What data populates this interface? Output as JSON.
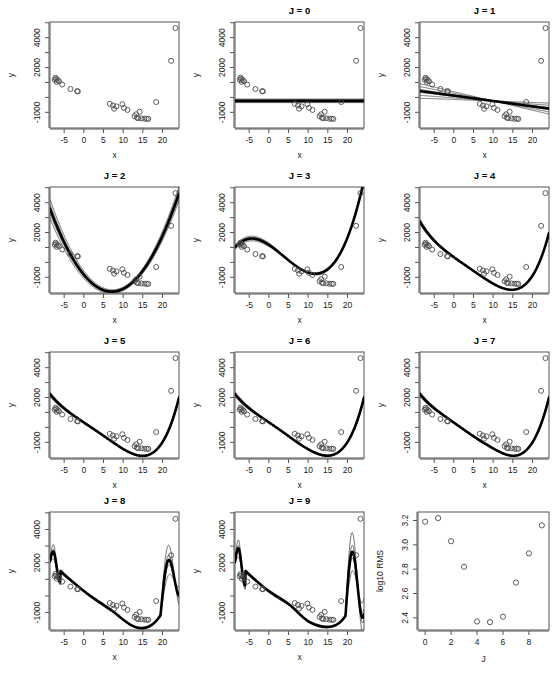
{
  "figure": {
    "title": "",
    "rows": 4,
    "cols": 3,
    "panel_count": 12
  },
  "axis_labels": {
    "x": "x",
    "y": "y",
    "rms_x": "J",
    "rms_y": "log10 RMS"
  },
  "panel_titles": {
    "p0": "",
    "p1": "J = 0",
    "p2": "J = 1",
    "p3": "J = 2",
    "p4": "J = 3",
    "p5": "J = 4",
    "p6": "J = 5",
    "p7": "J = 6",
    "p8": "J = 7",
    "p9": "J = 8",
    "p10": "J = 9",
    "p11": ""
  },
  "scatter_axes": {
    "xlim": [
      -8.6,
      24.2
    ],
    "ylim": [
      -2050,
      5050
    ],
    "x_ticks": [
      -5,
      0,
      5,
      10,
      15,
      20
    ],
    "x_tick_labels": [
      "-5",
      "0",
      "5",
      "10",
      "15",
      "20"
    ],
    "y_ticks": [
      -1000,
      0,
      1000,
      2000,
      3000,
      4000,
      5000
    ],
    "y_tick_labels": [
      "-1000",
      "",
      "",
      "2000",
      "",
      "4000",
      ""
    ],
    "grid": false
  },
  "chart_data": [
    {
      "type": "scatter",
      "title": "",
      "xlabel": "x",
      "ylabel": "y",
      "xlim": [
        -8.6,
        24.2
      ],
      "ylim": [
        -2050,
        5050
      ],
      "grid": false,
      "x": [
        -7.4,
        -7.2,
        -7.0,
        -6.9,
        -6.6,
        -6.3,
        -5.5,
        -3.4,
        -1.7,
        -1.5,
        6.6,
        7.4,
        7.7,
        8.3,
        9.8,
        10.2,
        11.1,
        12.9,
        13.3,
        13.5,
        13.8,
        14.2,
        14.6,
        15.4,
        16.0,
        16.4,
        18.4,
        22.2,
        23.3
      ],
      "y": [
        1180,
        1320,
        1230,
        1040,
        1160,
        1080,
        860,
        560,
        420,
        400,
        -430,
        -540,
        -760,
        -600,
        -460,
        -700,
        -840,
        -1260,
        -1130,
        -1360,
        -1390,
        -960,
        -1400,
        -1430,
        -1430,
        -1440,
        -310,
        2450,
        4640
      ],
      "series": []
    },
    {
      "type": "line",
      "title": "J = 0",
      "degree": 0,
      "xlabel": "x",
      "ylabel": "y",
      "main_fit_coeffs": [
        -230
      ],
      "bootstrap_fits": [
        [
          -150
        ],
        [
          -200
        ],
        [
          -260
        ],
        [
          -310
        ],
        [
          -120
        ],
        [
          -350
        ]
      ]
    },
    {
      "type": "line",
      "title": "J = 1",
      "degree": 1,
      "xlabel": "x",
      "ylabel": "y",
      "main_fit_coeffs": [
        120,
        -36
      ],
      "bootstrap_fits": [
        [
          260,
          -62
        ],
        [
          180,
          -50
        ],
        [
          60,
          -28
        ],
        [
          420,
          -86
        ],
        [
          330,
          -74
        ],
        [
          -20,
          -18
        ]
      ]
    },
    {
      "type": "line",
      "title": "J = 2",
      "degree": 2,
      "xlabel": "x",
      "ylabel": "y",
      "main_fit_coeffs": [
        -820,
        -320,
        22.5
      ],
      "bootstrap_fits": [
        [
          -620,
          -280,
          18.5
        ],
        [
          -700,
          -300,
          20.0
        ],
        [
          -900,
          -330,
          23.5
        ],
        [
          -520,
          -250,
          16.0
        ],
        [
          -760,
          -310,
          21.5
        ]
      ]
    },
    {
      "type": "line",
      "title": "J = 3",
      "degree": 3,
      "xlabel": "x",
      "ylabel": "y",
      "main_fit_coeffs": [
        1180,
        -172,
        -12.6,
        1.12
      ],
      "bootstrap_fits": [
        [
          1250,
          -160,
          -13.4,
          1.16
        ],
        [
          1100,
          -185,
          -11.8,
          1.08
        ],
        [
          1320,
          -150,
          -14.0,
          1.2
        ],
        [
          1040,
          -195,
          -11.2,
          1.04
        ]
      ]
    },
    {
      "type": "line",
      "title": "J = 4",
      "degree": 4,
      "xlabel": "x",
      "ylabel": "y",
      "main_fit_coeffs": [
        350,
        -190,
        3.0,
        -0.52,
        0.0345
      ],
      "bootstrap_fits": [
        [
          380,
          -186,
          2.8,
          -0.5,
          0.034
        ],
        [
          330,
          -194,
          3.2,
          -0.54,
          0.035
        ]
      ]
    },
    {
      "type": "line",
      "title": "J = 5",
      "degree": 5,
      "xlabel": "x",
      "ylabel": "y",
      "main_fit_coeffs": [
        330,
        -175,
        0.5,
        -0.35,
        0.0255,
        0.00022
      ],
      "bootstrap_fits": [
        [
          360,
          -170,
          0.2,
          -0.33,
          0.0248,
          0.00026
        ],
        [
          300,
          -180,
          0.9,
          -0.37,
          0.0262,
          0.00018
        ],
        [
          345,
          -178,
          0.6,
          -0.36,
          0.0258,
          0.0002
        ]
      ]
    },
    {
      "type": "line",
      "title": "J = 6",
      "degree": 6,
      "xlabel": "x",
      "ylabel": "y",
      "main_fit_coeffs": [
        330,
        -175,
        0.5,
        -0.35,
        0.0255,
        0.00022,
        2.2e-06
      ],
      "bootstrap_fits": [
        [
          360,
          -168,
          0.1,
          -0.33,
          0.0249,
          0.00025,
          2.1e-06
        ],
        [
          305,
          -182,
          0.9,
          -0.37,
          0.0261,
          0.00019,
          2.3e-06
        ]
      ]
    },
    {
      "type": "line",
      "title": "J = 7",
      "degree": 7,
      "xlabel": "x",
      "ylabel": "y",
      "main_fit_coeffs": [
        330,
        -175,
        0.5,
        -0.35,
        0.0255,
        0.00022,
        2.2e-06,
        2e-08
      ],
      "bootstrap_fits": [
        [
          365,
          -166,
          0.0,
          -0.32,
          0.0247,
          0.00026,
          2e-06,
          2.2e-08
        ],
        [
          300,
          -184,
          1.0,
          -0.38,
          0.0263,
          0.00018,
          2.4e-06,
          1.8e-08
        ]
      ]
    },
    {
      "type": "line",
      "title": "J = 8",
      "degree": 8,
      "xlabel": "x",
      "ylabel": "y",
      "note": "strong edge oscillation near x = 23",
      "main_fit_coeffs": [],
      "bootstrap_fits": []
    },
    {
      "type": "line",
      "title": "J = 9",
      "degree": 9,
      "xlabel": "x",
      "ylabel": "y",
      "note": "strong edge oscillation near x = 23",
      "main_fit_coeffs": [],
      "bootstrap_fits": []
    },
    {
      "type": "scatter",
      "title": "",
      "xlabel": "J",
      "ylabel": "log10 RMS",
      "xlim": [
        -0.55,
        9.55
      ],
      "ylim": [
        2.3,
        3.27
      ],
      "x_ticks": [
        0,
        2,
        4,
        6,
        8
      ],
      "x_tick_labels": [
        "0",
        "2",
        "4",
        "6",
        "8"
      ],
      "y_ticks": [
        2.4,
        2.6,
        2.8,
        3.0,
        3.2
      ],
      "y_tick_labels": [
        "2.4",
        "2.6",
        "2.8",
        "3.0",
        "3.2"
      ],
      "grid": false,
      "x": [
        0,
        1,
        2,
        3,
        4,
        5,
        6,
        7,
        8,
        9
      ],
      "y": [
        3.19,
        3.22,
        3.03,
        2.82,
        2.37,
        2.365,
        2.41,
        2.69,
        2.93,
        3.16
      ]
    }
  ]
}
